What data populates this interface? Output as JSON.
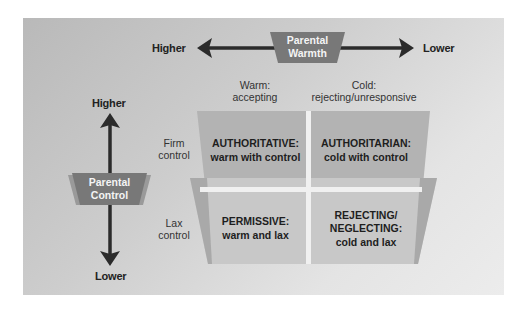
{
  "colors": {
    "panel_dark": "#b9b9b9",
    "panel_light": "#ececec",
    "badge": "#7a7a7a",
    "arrow": "#2b2b2b",
    "quadrant_top": "#b4b4b4",
    "quadrant_bottom": "#c9c9c9",
    "divider": "#f2f2f2"
  },
  "warmth_axis": {
    "title_line1": "Parental",
    "title_line2": "Warmth",
    "left_label": "Higher",
    "right_label": "Lower",
    "columns": [
      {
        "line1": "Warm:",
        "line2": "accepting"
      },
      {
        "line1": "Cold:",
        "line2": "rejecting/unresponsive"
      }
    ]
  },
  "control_axis": {
    "title_line1": "Parental",
    "title_line2": "Control",
    "top_label": "Higher",
    "bottom_label": "Lower",
    "rows": [
      {
        "line1": "Firm",
        "line2": "control"
      },
      {
        "line1": "Lax",
        "line2": "control"
      }
    ]
  },
  "quadrants": [
    {
      "title": "AUTHORITATIVE:",
      "lines": [
        "warm with control"
      ]
    },
    {
      "title": "AUTHORITARIAN:",
      "lines": [
        "cold with control"
      ]
    },
    {
      "title": "PERMISSIVE:",
      "lines": [
        "warm and lax"
      ]
    },
    {
      "title": "REJECTING/",
      "lines": [
        "NEGLECTING:",
        "cold and lax"
      ]
    }
  ]
}
